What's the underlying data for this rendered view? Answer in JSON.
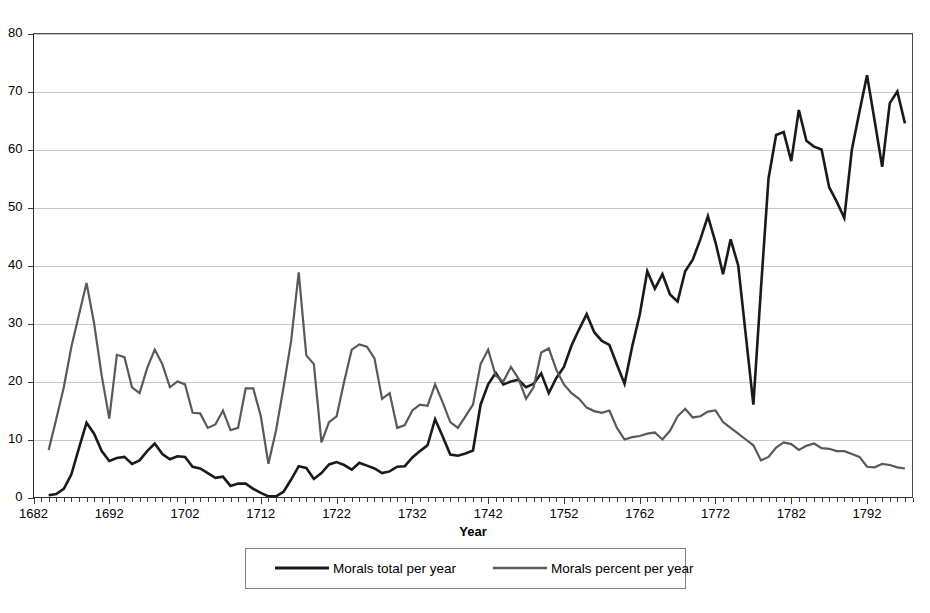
{
  "chart_data": {
    "type": "line",
    "title": "",
    "xlabel": "Year",
    "ylabel": "",
    "xlim": [
      1682,
      1798
    ],
    "ylim": [
      0,
      80
    ],
    "grid": true,
    "legend_position": "bottom",
    "x_tick_labels": [
      "1682",
      "1692",
      "1702",
      "1712",
      "1722",
      "1732",
      "1742",
      "1752",
      "1762",
      "1772",
      "1782",
      "1792"
    ],
    "x_tick_values": [
      1682,
      1692,
      1702,
      1712,
      1722,
      1732,
      1742,
      1752,
      1762,
      1772,
      1782,
      1792
    ],
    "y_tick_labels": [
      "0",
      "10",
      "20",
      "30",
      "40",
      "50",
      "60",
      "70",
      "80"
    ],
    "y_tick_values": [
      0,
      10,
      20,
      30,
      40,
      50,
      60,
      70,
      80
    ],
    "minor_x_tick_step": 1,
    "x": [
      1684,
      1685,
      1686,
      1687,
      1688,
      1689,
      1690,
      1691,
      1692,
      1693,
      1694,
      1695,
      1696,
      1697,
      1698,
      1699,
      1700,
      1701,
      1702,
      1703,
      1704,
      1705,
      1706,
      1707,
      1708,
      1709,
      1710,
      1711,
      1712,
      1713,
      1714,
      1715,
      1716,
      1717,
      1718,
      1719,
      1720,
      1721,
      1722,
      1723,
      1724,
      1725,
      1726,
      1727,
      1728,
      1729,
      1730,
      1731,
      1732,
      1733,
      1734,
      1735,
      1736,
      1737,
      1738,
      1739,
      1740,
      1741,
      1742,
      1743,
      1744,
      1745,
      1746,
      1747,
      1748,
      1749,
      1750,
      1751,
      1752,
      1753,
      1754,
      1755,
      1756,
      1757,
      1758,
      1759,
      1760,
      1761,
      1762,
      1763,
      1764,
      1765,
      1766,
      1767,
      1768,
      1769,
      1770,
      1771,
      1772,
      1773,
      1774,
      1775,
      1776,
      1777,
      1778,
      1779,
      1780,
      1781,
      1782,
      1783,
      1784,
      1785,
      1786,
      1787,
      1788,
      1789,
      1790,
      1791,
      1792,
      1793,
      1794,
      1795,
      1796,
      1797
    ],
    "series": [
      {
        "name": "Morals total per year",
        "color": "#1a1a1a",
        "width": 2.6,
        "values": [
          0.4,
          0.6,
          1.5,
          4.0,
          8.5,
          12.9,
          11.0,
          8.0,
          6.3,
          6.8,
          7.0,
          5.8,
          6.4,
          8.0,
          9.3,
          7.5,
          6.6,
          7.1,
          7.0,
          5.3,
          5.0,
          4.2,
          3.4,
          3.6,
          2.0,
          2.4,
          2.4,
          1.5,
          0.8,
          0.2,
          0.2,
          1.0,
          3.1,
          5.4,
          5.1,
          3.2,
          4.2,
          5.7,
          6.1,
          5.6,
          4.8,
          6.0,
          5.5,
          5.0,
          4.2,
          4.5,
          5.3,
          5.4,
          6.9,
          8.0,
          9.0,
          13.5,
          10.5,
          7.4,
          7.2,
          7.6,
          8.1,
          16.0,
          19.5,
          21.5,
          19.5,
          20.0,
          20.3,
          19.0,
          19.6,
          21.4,
          18.0,
          20.6,
          22.5,
          26.2,
          29.0,
          31.6,
          28.5,
          27.0,
          26.3,
          22.9,
          19.6,
          26.0,
          31.5,
          39.0,
          36.0,
          38.5,
          35.0,
          33.8,
          39.0,
          41.0,
          44.5,
          48.5,
          44.0,
          38.5,
          44.5,
          40.0,
          28.0,
          16.0,
          36.0,
          55.0,
          62.5,
          63.0,
          58.0,
          66.8,
          61.5,
          60.5,
          60.0,
          53.5,
          51.0,
          48.2,
          60.0,
          66.5,
          72.8,
          65.0,
          57.0,
          68.0,
          70.0,
          64.5
        ]
      },
      {
        "name": "Morals percent per year",
        "color": "#595959",
        "width": 2.2,
        "values": [
          8.2,
          13.5,
          19.0,
          26.0,
          31.5,
          37.0,
          30.0,
          21.0,
          13.6,
          24.6,
          24.2,
          19.0,
          18.0,
          22.3,
          25.5,
          23.0,
          19.0,
          20.0,
          19.5,
          14.6,
          14.5,
          12.0,
          12.6,
          15.0,
          11.6,
          12.0,
          18.8,
          18.8,
          14.0,
          5.8,
          11.5,
          19.0,
          27.0,
          38.8,
          24.5,
          23.0,
          9.5,
          13.0,
          14.0,
          20.0,
          25.5,
          26.4,
          26.0,
          24.0,
          17.0,
          18.0,
          12.0,
          12.5,
          15.0,
          16.0,
          15.8,
          19.5,
          16.4,
          13.0,
          12.0,
          14.0,
          16.0,
          23.0,
          25.5,
          21.0,
          20.0,
          22.5,
          20.5,
          17.0,
          19.0,
          25.0,
          25.7,
          22.0,
          19.5,
          18.0,
          17.0,
          15.5,
          14.9,
          14.6,
          15.0,
          12.0,
          10.0,
          10.4,
          10.6,
          11.0,
          11.2,
          10.0,
          11.5,
          14.0,
          15.3,
          13.8,
          14.0,
          14.8,
          15.0,
          13.0,
          12.0,
          11.0,
          10.0,
          9.0,
          6.4,
          7.0,
          8.6,
          9.5,
          9.2,
          8.2,
          8.9,
          9.3,
          8.5,
          8.4,
          8.0,
          8.0,
          7.5,
          7.0,
          5.3,
          5.2,
          5.8,
          5.6,
          5.2,
          5.0
        ]
      }
    ],
    "legend": [
      {
        "label": "Morals total per year",
        "color": "#1a1a1a"
      },
      {
        "label": "Morals percent per year",
        "color": "#595959"
      }
    ]
  },
  "axis": {
    "x_title": "Year"
  }
}
